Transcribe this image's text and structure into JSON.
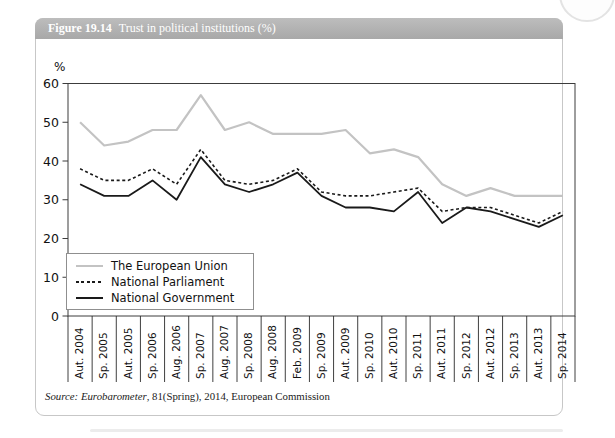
{
  "page": {
    "figure_label": "Figure 19.14",
    "figure_title": "Trust in political institutions (%)",
    "source_italic": "Source: Eurobarometer",
    "source_rest": ", 81(Spring), 2014, European Commission"
  },
  "chart_data": {
    "type": "line",
    "title": "Trust in political institutions (%)",
    "unit_label": "%",
    "xlabel": "",
    "ylabel": "%",
    "ylim": [
      0,
      60
    ],
    "yticks": [
      0,
      10,
      20,
      30,
      40,
      50,
      60
    ],
    "grid": false,
    "legend_position": "bottom-left-inside",
    "categories": [
      "Aut. 2004",
      "Sp. 2005",
      "Aut. 2005",
      "Sp. 2006",
      "Aug. 2006",
      "Sp. 2007",
      "Aug. 2007",
      "Sp. 2008",
      "Aug. 2008",
      "Feb. 2009",
      "Sp. 2009",
      "Aut. 2009",
      "Sp. 2010",
      "Aut. 2010",
      "Sp. 2011",
      "Aut. 2011",
      "Sp. 2012",
      "Aut. 2012",
      "Sp. 2013",
      "Aut. 2013",
      "Sp. 2014"
    ],
    "series": [
      {
        "name": "The European Union",
        "style": "solid",
        "color": "#c3c3c3",
        "stroke_width": 2.2,
        "values": [
          50,
          44,
          45,
          48,
          48,
          57,
          48,
          50,
          47,
          47,
          47,
          48,
          42,
          43,
          41,
          34,
          31,
          33,
          31,
          31,
          31
        ]
      },
      {
        "name": "National Parliament",
        "style": "dashed",
        "color": "#1a1a1a",
        "stroke_width": 1.6,
        "values": [
          38,
          35,
          35,
          38,
          34,
          43,
          35,
          34,
          35,
          38,
          32,
          31,
          31,
          32,
          33,
          27,
          28,
          28,
          26,
          24,
          27
        ]
      },
      {
        "name": "National Government",
        "style": "solid",
        "color": "#1a1a1a",
        "stroke_width": 1.8,
        "values": [
          34,
          31,
          31,
          35,
          30,
          41,
          34,
          32,
          34,
          37,
          31,
          28,
          28,
          27,
          32,
          24,
          28,
          27,
          25,
          23,
          26
        ]
      }
    ]
  }
}
